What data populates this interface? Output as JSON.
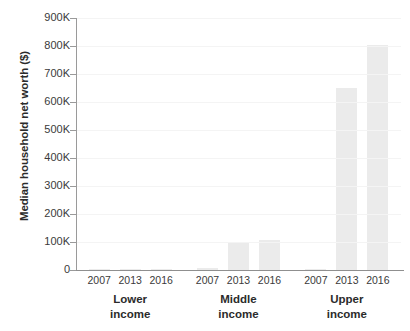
{
  "chart_data": {
    "type": "bar",
    "title": "",
    "subtitle": "",
    "xlabel": "",
    "ylabel": "Median household net worth ($)",
    "ylim": [
      0,
      900000
    ],
    "ytick_values": [
      0,
      100000,
      200000,
      300000,
      400000,
      500000,
      600000,
      700000,
      800000,
      900000
    ],
    "ytick_labels": [
      "0",
      "100K",
      "200K",
      "300K",
      "400K",
      "500K",
      "600K",
      "700K",
      "800K",
      "900K"
    ],
    "grid": true,
    "legend": "none",
    "bar_color": "#ebebeb",
    "axis_color": "#9a9a9a",
    "categories": [
      "2007",
      "2013",
      "2016"
    ],
    "groups": [
      {
        "label_line1": "Lower",
        "label_line2": "income",
        "values": [
          3000,
          2000,
          4000
        ]
      },
      {
        "label_line1": "Middle",
        "label_line2": "income",
        "values": [
          6000,
          100000,
          108000
        ]
      },
      {
        "label_line1": "Upper",
        "label_line2": "income",
        "values": [
          4000,
          650000,
          805000
        ]
      }
    ],
    "series": [
      {
        "name": "2007",
        "values": [
          3000,
          6000,
          4000
        ]
      },
      {
        "name": "2013",
        "values": [
          2000,
          100000,
          650000
        ]
      },
      {
        "name": "2016",
        "values": [
          4000,
          108000,
          805000
        ]
      }
    ],
    "x_tick_labels": [
      "2007",
      "2013",
      "2016",
      "2007",
      "2013",
      "2016",
      "2007",
      "2013",
      "2016"
    ]
  }
}
